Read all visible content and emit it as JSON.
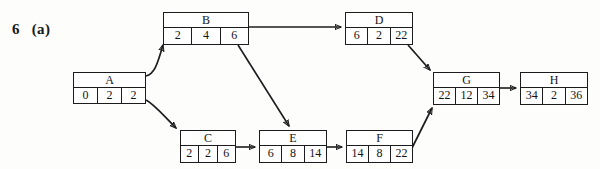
{
  "figure": {
    "problem_number": "6",
    "part_label": "(a)",
    "scan_remnant": "",
    "type": "activity-on-node project network diagram"
  },
  "nodes": [
    {
      "id": "A",
      "name": "A",
      "cells": [
        "0",
        "2",
        "2"
      ]
    },
    {
      "id": "B",
      "name": "B",
      "cells": [
        "2",
        "4",
        "6"
      ]
    },
    {
      "id": "C",
      "name": "C",
      "cells": [
        "2",
        "2",
        "6"
      ]
    },
    {
      "id": "D",
      "name": "D",
      "cells": [
        "6",
        "2",
        "22"
      ]
    },
    {
      "id": "E",
      "name": "E",
      "cells": [
        "6",
        "8",
        "14"
      ]
    },
    {
      "id": "F",
      "name": "F",
      "cells": [
        "14",
        "8",
        "22"
      ]
    },
    {
      "id": "G",
      "name": "G",
      "cells": [
        "22",
        "12",
        "34"
      ]
    },
    {
      "id": "H",
      "name": "H",
      "cells": [
        "34",
        "2",
        "36"
      ]
    }
  ],
  "edges": [
    {
      "from": "A",
      "to": "B"
    },
    {
      "from": "A",
      "to": "C"
    },
    {
      "from": "B",
      "to": "D"
    },
    {
      "from": "B",
      "to": "E"
    },
    {
      "from": "C",
      "to": "E"
    },
    {
      "from": "D",
      "to": "G"
    },
    {
      "from": "E",
      "to": "F"
    },
    {
      "from": "F",
      "to": "G"
    },
    {
      "from": "G",
      "to": "H"
    }
  ],
  "colors": {
    "ink": "#1c1c1e",
    "paper": "#fdfdfb"
  }
}
